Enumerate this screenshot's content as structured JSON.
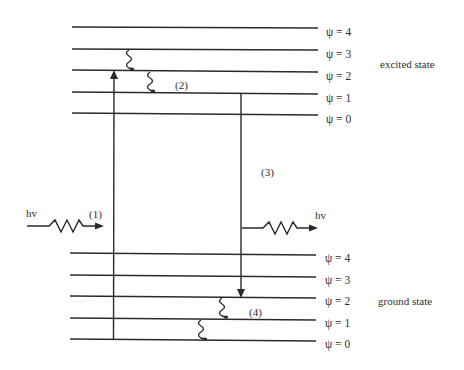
{
  "diagram": {
    "type": "energy-level (Jablonski-style) diagram",
    "excited_state": {
      "label": "excited state",
      "levels": [
        {
          "name": "ψ = 4",
          "y": 27
        },
        {
          "name": "ψ = 3",
          "y": 49
        },
        {
          "name": "ψ = 2",
          "y": 71
        },
        {
          "name": "ψ = 1",
          "y": 93
        },
        {
          "name": "ψ = 0",
          "y": 114
        }
      ]
    },
    "ground_state": {
      "label": "ground state",
      "levels": [
        {
          "name": "ψ = 4",
          "y": 253
        },
        {
          "name": "ψ = 3",
          "y": 275
        },
        {
          "name": "ψ = 2",
          "y": 297
        },
        {
          "name": "ψ = 1",
          "y": 318
        },
        {
          "name": "ψ = 0",
          "y": 340
        }
      ]
    },
    "processes": [
      {
        "id": "(1)",
        "description": "absorption: hv photon in, ground ψ=0 → excited ψ=2"
      },
      {
        "id": "(2)",
        "description": "vibrational relaxation in excited state (wavy arrows)"
      },
      {
        "id": "(3)",
        "description": "emission: excited ψ=1 → ground ψ=2, hv photon out"
      },
      {
        "id": "(4)",
        "description": "vibrational relaxation in ground state (wavy arrows)"
      }
    ],
    "labels": {
      "photon_in": "hv",
      "photon_out": "hv",
      "step1": "(1)",
      "step2": "(2)",
      "step3": "(3)",
      "step4": "(4)"
    },
    "colors": {
      "line": "#2a2a2a",
      "background": "#ffffff"
    }
  }
}
